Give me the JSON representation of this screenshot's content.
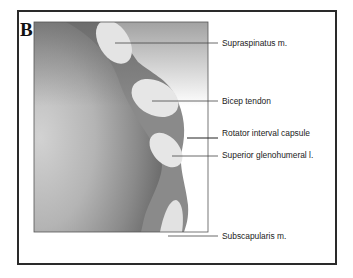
{
  "figure": {
    "panel_letter": "B",
    "labels": [
      {
        "id": "supraspinatus",
        "text": "Supraspinatus m."
      },
      {
        "id": "bicep-tendon",
        "text": "Bicep tendon"
      },
      {
        "id": "rotator-interval-capsule",
        "text": "Rotator interval capsule"
      },
      {
        "id": "superior-glenohumeral",
        "text": "Superior glenohumeral l."
      },
      {
        "id": "subscapularis",
        "text": "Subscapularis m."
      }
    ],
    "colors": {
      "capsule": "#8a8a8a",
      "structure_fill": "#e6e6e6",
      "head_dark": "#6a6a6a",
      "head_light": "#c9c9c9",
      "leader_line": "#444444",
      "frame": "#2a2a2a"
    }
  }
}
